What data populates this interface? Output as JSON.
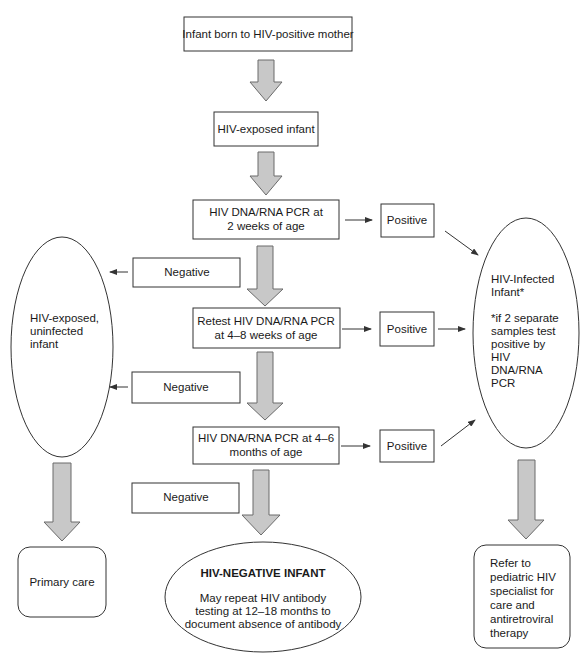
{
  "nodes": {
    "start": {
      "lines": [
        "Infant born to HIV-positive mother"
      ]
    },
    "exposed": {
      "lines": [
        "HIV-exposed infant"
      ]
    },
    "pcr_2wk": {
      "lines": [
        "HIV DNA/RNA PCR at",
        "2 weeks of age"
      ]
    },
    "pcr_4_8wk": {
      "lines": [
        "Retest HIV DNA/RNA PCR",
        "at 4–8 weeks of age"
      ]
    },
    "pcr_4_6mo": {
      "lines": [
        "HIV DNA/RNA PCR at 4–6",
        "months of age"
      ]
    },
    "positive_1": {
      "lines": [
        "Positive"
      ]
    },
    "positive_2": {
      "lines": [
        "Positive"
      ]
    },
    "positive_3": {
      "lines": [
        "Positive"
      ]
    },
    "negative_1": {
      "lines": [
        "Negative"
      ]
    },
    "negative_2": {
      "lines": [
        "Negative"
      ]
    },
    "negative_3": {
      "lines": [
        "Negative"
      ]
    },
    "uninfected": {
      "lines": [
        "HIV-exposed,",
        "uninfected",
        "infant"
      ]
    },
    "infected": {
      "lines": [
        "HIV-Infected",
        "Infant*",
        "",
        "*if 2 separate",
        "samples test",
        "positive by",
        "HIV",
        "DNA/RNA",
        "PCR"
      ]
    },
    "hiv_negative": {
      "heading": "HIV-NEGATIVE INFANT",
      "lines": [
        "May repeat HIV antibody",
        "testing at 12–18 months to",
        "document absence of antibody"
      ]
    },
    "primary_care": {
      "lines": [
        "Primary care"
      ]
    },
    "refer": {
      "lines": [
        "Refer to",
        "pediatric HIV",
        "specialist for",
        "care and",
        "antiretroviral",
        "therapy"
      ]
    }
  },
  "colors": {
    "arrow_fill": "#c8c8c8",
    "arrow_stroke": "#6a6a6a",
    "line": "#333333",
    "text": "#1a1a1a"
  }
}
